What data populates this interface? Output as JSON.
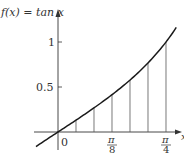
{
  "chart_data": {
    "type": "line",
    "title": "f(x) = tan x",
    "function": "tan x",
    "xlabel": "x",
    "ylabel": "f(x) = tan x",
    "x_ticks": [
      {
        "value": 0,
        "label": "0"
      },
      {
        "value": 0.3927,
        "label_num": "π",
        "label_den": "8"
      },
      {
        "value": 0.7854,
        "label_num": "π",
        "label_den": "4"
      }
    ],
    "y_ticks": [
      {
        "value": 0.5,
        "label": "0.5"
      },
      {
        "value": 1,
        "label": "1"
      }
    ],
    "partition_x": [
      0,
      0.1309,
      0.2618,
      0.3927,
      0.5236,
      0.6545,
      0.7854
    ],
    "partition_y": [
      0,
      0.1317,
      0.2679,
      0.4142,
      0.5774,
      0.7673,
      1.0
    ],
    "subintervals": 6,
    "xlim": [
      -0.16,
      0.86
    ],
    "ylim": [
      -0.16,
      1.2
    ],
    "grid": false,
    "legend": "none"
  },
  "labels": {
    "func": "f(x) = tan x",
    "y1": "1",
    "y05": "0.5",
    "origin": "0",
    "pi": "π",
    "den8": "8",
    "den4": "4",
    "xaxis": "x"
  },
  "colors": {
    "curve": "#1a1a1a",
    "axis": "#333333",
    "lines": "#555555"
  }
}
